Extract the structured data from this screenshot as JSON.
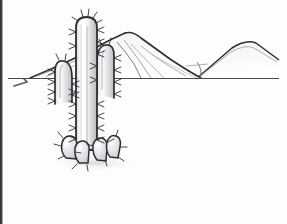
{
  "artwork": {
    "title": "Saguaro cactus with desert mountains",
    "medium": "pencil line drawing",
    "caption": "",
    "paper_color": "#fdfdfc",
    "ink_color": "#2f2f33",
    "shade_color": "#c9c9cd",
    "highlight_color": "#ffffff",
    "border_color": "#2b2b2b"
  },
  "scene": {
    "horizon": {
      "label": "horizon-line",
      "y": 78,
      "x_start": 8,
      "x_end": 279,
      "color": "#4a4a4e"
    },
    "mountains": [
      {
        "name": "near-peak",
        "apex_x": 125,
        "apex_y": 33,
        "left_base_x": 30,
        "right_base_x": 200,
        "label": "main mountain"
      },
      {
        "name": "far-peak",
        "apex_x": 248,
        "apex_y": 42,
        "left_base_x": 196,
        "right_base_x": 279,
        "label": "right mountain"
      }
    ],
    "cactus": {
      "name": "saguaro",
      "trunk": {
        "left_x": 76,
        "right_x": 97,
        "top_y": 17,
        "bottom_y": 150
      },
      "arms": [
        {
          "side": "left",
          "elbow_x": 64,
          "top_y": 57
        },
        {
          "side": "right",
          "elbow_x": 112,
          "top_y": 45
        }
      ],
      "spine_count": 46,
      "base_pads": 4
    },
    "stray_marks": [
      {
        "name": "pencil-smudge-left",
        "x": 20,
        "y": 84
      }
    ]
  }
}
